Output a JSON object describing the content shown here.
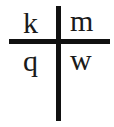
{
  "diagram": {
    "type": "cross",
    "line_color": "#111111",
    "quadrants": {
      "top_left": "k",
      "top_right": "m",
      "bottom_left": "q",
      "bottom_right": "w"
    }
  }
}
